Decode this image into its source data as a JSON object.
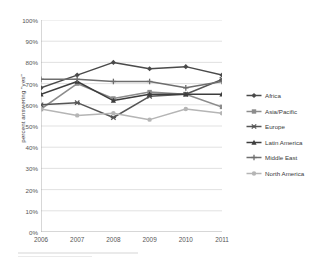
{
  "chart_data": {
    "type": "line",
    "title": "",
    "xlabel": "",
    "ylabel": "percent answering \"yes\"",
    "categories": [
      "2006",
      "2007",
      "2008",
      "2009",
      "2010",
      "2011"
    ],
    "x": [
      2006,
      2007,
      2008,
      2009,
      2010,
      2011
    ],
    "ylim": [
      0,
      100
    ],
    "yticks": [
      "0%",
      "10%",
      "20%",
      "30%",
      "40%",
      "50%",
      "60%",
      "70%",
      "80%",
      "90%",
      "100%"
    ],
    "ytick_values": [
      0,
      10,
      20,
      30,
      40,
      50,
      60,
      70,
      80,
      90,
      100
    ],
    "grid": true,
    "grid_axis": "y",
    "legend_position": "right",
    "value_suffix": "%",
    "series": [
      {
        "name": "Africa",
        "values": [
          68,
          74,
          80,
          77,
          78,
          74
        ],
        "color": "#4a4a4a",
        "marker": "diamond",
        "width": 1.5
      },
      {
        "name": "Asia/Pacific",
        "values": [
          58,
          70,
          63,
          66,
          65,
          59
        ],
        "color": "#8c8c8c",
        "marker": "square",
        "width": 1.5
      },
      {
        "name": "Europe",
        "values": [
          60,
          61,
          54,
          64,
          65,
          72
        ],
        "color": "#555555",
        "marker": "star",
        "width": 1.5
      },
      {
        "name": "Latin America",
        "values": [
          65,
          71,
          62,
          65,
          65,
          65
        ],
        "color": "#3d3d3d",
        "marker": "triangle",
        "width": 1.5
      },
      {
        "name": "Middle East",
        "values": [
          72,
          72,
          71,
          71,
          68,
          71
        ],
        "color": "#6e6e6e",
        "marker": "cross",
        "width": 1.5
      },
      {
        "name": "North America",
        "values": [
          58,
          55,
          56,
          53,
          58,
          56
        ],
        "color": "#b5b5b5",
        "marker": "circle",
        "width": 1.5
      }
    ]
  },
  "axes": {
    "y_axis_label": "percent answering \"yes\"",
    "y_tick_labels": [
      "100%",
      "90%",
      "80%",
      "70%",
      "60%",
      "50%",
      "40%",
      "30%",
      "20%",
      "10%",
      "0%"
    ],
    "x_tick_labels": [
      "2006",
      "2007",
      "2008",
      "2009",
      "2010",
      "2011"
    ]
  },
  "legend": {
    "items": [
      {
        "label": "Africa"
      },
      {
        "label": "Asia/Pacific"
      },
      {
        "label": "Europe"
      },
      {
        "label": "Latin America"
      },
      {
        "label": "Middle East"
      },
      {
        "label": "North America"
      }
    ]
  },
  "style": {
    "background": "#ffffff",
    "grid_color": "#d9d9d9",
    "axis_color": "#a6a6a6",
    "text_color": "#555555"
  }
}
